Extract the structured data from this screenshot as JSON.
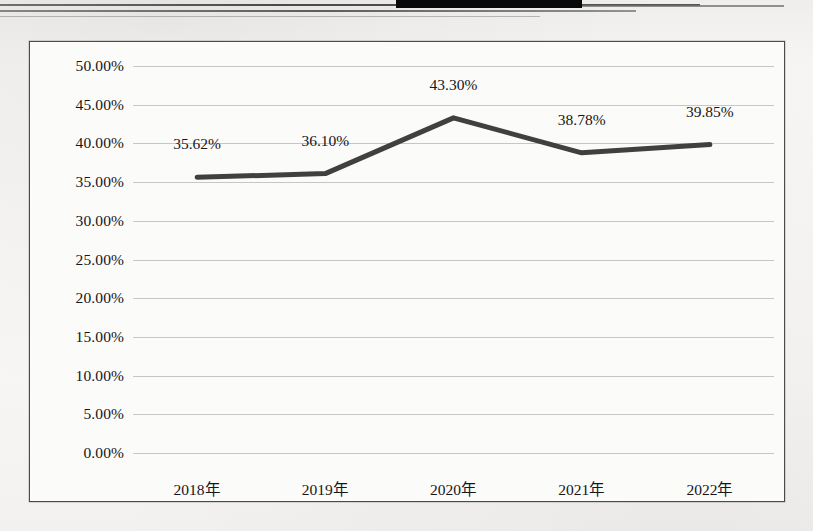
{
  "document": {
    "background_color": "#f4f3f1",
    "top_rules_color": "#3a3a3a",
    "redaction_color": "#08090a",
    "redaction_label": "redacted-black-bar"
  },
  "chart_frame": {
    "border_color": "#4b4b4b",
    "fill_color": "#fbfbfa"
  },
  "chart_data": {
    "type": "line",
    "title": "",
    "subtitle": "",
    "xlabel": "",
    "ylabel": "",
    "categories": [
      "2018年",
      "2019年",
      "2020年",
      "2021年",
      "2022年"
    ],
    "values": [
      35.62,
      36.1,
      43.3,
      38.78,
      39.85
    ],
    "data_labels": [
      "35.62%",
      "36.10%",
      "43.30%",
      "38.78%",
      "39.85%"
    ],
    "ylim": [
      0,
      50
    ],
    "ytick_step": 5,
    "ytick_labels": [
      "50.00%",
      "45.00%",
      "40.00%",
      "35.00%",
      "30.00%",
      "25.00%",
      "20.00%",
      "15.00%",
      "10.00%",
      "5.00%",
      "0.00%"
    ],
    "ytick_values": [
      50,
      45,
      40,
      35,
      30,
      25,
      20,
      15,
      10,
      5,
      0
    ],
    "grid": true,
    "grid_color": "#c6c6c6",
    "legend": "none",
    "series_color": "#404040",
    "series_width_px": 5,
    "series_name": ""
  }
}
